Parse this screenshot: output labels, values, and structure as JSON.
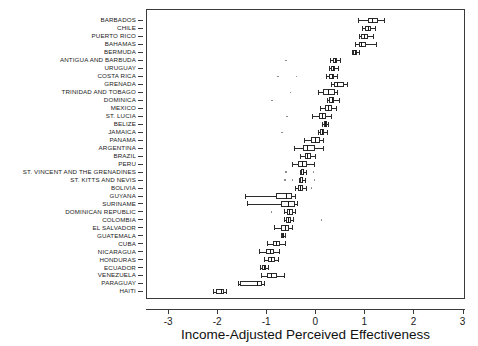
{
  "figure": {
    "artifact_text_top": "cut-off scanned header text",
    "background": "#ffffff",
    "line_color": "#2b2b2b"
  },
  "axis": {
    "x_title": "Income-Adjusted Perceived Effectiveness",
    "x_ticks": [
      -3,
      -2,
      -1,
      0,
      1,
      2,
      3
    ],
    "x_tick_labels": [
      "-3",
      "-2",
      "-1",
      "0",
      "1",
      "2",
      "3"
    ],
    "x_min": -3.45,
    "x_max": 3.05,
    "y_title": "",
    "grid": "off"
  },
  "chart_data": {
    "type": "box",
    "orientation": "horizontal",
    "title": "",
    "subtitle": "",
    "xlabel": "Income-Adjusted Perceived Effectiveness",
    "ylabel": "",
    "xlim": [
      -3.45,
      3.05
    ],
    "legend": "none",
    "categories": [
      "BARBADOS",
      "CHILE",
      "PUERTO RICO",
      "BAHAMAS",
      "BERMUDA",
      "ANTIGUA AND BARBUDA",
      "URUGUAY",
      "COSTA RICA",
      "GRENADA",
      "TRINIDAD AND TOBAGO",
      "DOMINICA",
      "MEXICO",
      "ST. LUCIA",
      "BELIZE",
      "JAMAICA",
      "PANAMA",
      "ARGENTINA",
      "BRAZIL",
      "PERU",
      "ST. VINCENT AND THE GRENADINES",
      "ST. KITTS AND NEVIS",
      "BOLIVIA",
      "GUYANA",
      "SURINAME",
      "DOMINICAN REPUBLIC",
      "COLOMBIA",
      "EL SALVADOR",
      "GUATEMALA",
      "CUBA",
      "NICARAGUA",
      "HONDURAS",
      "ECUADOR",
      "VENEZUELA",
      "PARAGUAY",
      "HAITI"
    ],
    "boxes": [
      {
        "name": "BARBADOS",
        "whisker_low": 0.84,
        "q1": 1.06,
        "median": 1.14,
        "q3": 1.26,
        "whisker_high": 1.37,
        "outliers": []
      },
      {
        "name": "CHILE",
        "whisker_low": 0.94,
        "q1": 1.0,
        "median": 1.06,
        "q3": 1.12,
        "whisker_high": 1.2,
        "outliers": []
      },
      {
        "name": "PUERTO RICO",
        "whisker_low": 0.86,
        "q1": 0.92,
        "median": 0.98,
        "q3": 1.06,
        "whisker_high": 1.16,
        "outliers": []
      },
      {
        "name": "BAHAMAS",
        "whisker_low": 0.78,
        "q1": 0.86,
        "median": 0.92,
        "q3": 1.02,
        "whisker_high": 1.22,
        "outliers": []
      },
      {
        "name": "BERMUDA",
        "whisker_low": 0.72,
        "q1": 0.74,
        "median": 0.78,
        "q3": 0.82,
        "whisker_high": 0.86,
        "outliers": []
      },
      {
        "name": "ANTIGUA AND BARBUDA",
        "whisker_low": 0.28,
        "q1": 0.33,
        "median": 0.38,
        "q3": 0.43,
        "whisker_high": 0.48,
        "outliers": [
          -0.62
        ]
      },
      {
        "name": "URUGUAY",
        "whisker_low": 0.26,
        "q1": 0.3,
        "median": 0.34,
        "q3": 0.39,
        "whisker_high": 0.44,
        "outliers": []
      },
      {
        "name": "COSTA RICA",
        "whisker_low": 0.2,
        "q1": 0.26,
        "median": 0.31,
        "q3": 0.36,
        "whisker_high": 0.42,
        "outliers": [
          -0.78,
          -0.4
        ]
      },
      {
        "name": "GRENADA",
        "whisker_low": 0.3,
        "q1": 0.36,
        "median": 0.42,
        "q3": 0.56,
        "whisker_high": 0.62,
        "outliers": []
      },
      {
        "name": "TRINIDAD AND TOBAGO",
        "whisker_low": 0.03,
        "q1": 0.14,
        "median": 0.24,
        "q3": 0.38,
        "whisker_high": 0.42,
        "outliers": [
          -0.52
        ]
      },
      {
        "name": "DOMINICA",
        "whisker_low": 0.22,
        "q1": 0.26,
        "median": 0.31,
        "q3": 0.36,
        "whisker_high": 0.46,
        "outliers": [
          -0.9
        ]
      },
      {
        "name": "MEXICO",
        "whisker_low": 0.08,
        "q1": 0.18,
        "median": 0.24,
        "q3": 0.32,
        "whisker_high": 0.4,
        "outliers": []
      },
      {
        "name": "ST. LUCIA",
        "whisker_low": -0.08,
        "q1": 0.06,
        "median": 0.12,
        "q3": 0.2,
        "whisker_high": 0.3,
        "outliers": [
          -0.6
        ]
      },
      {
        "name": "BELIZE",
        "whisker_low": 0.12,
        "q1": 0.15,
        "median": 0.18,
        "q3": 0.21,
        "whisker_high": 0.24,
        "outliers": []
      },
      {
        "name": "JAMAICA",
        "whisker_low": 0.04,
        "q1": 0.08,
        "median": 0.12,
        "q3": 0.16,
        "whisker_high": 0.22,
        "outliers": [
          -0.7
        ]
      },
      {
        "name": "PANAMA",
        "whisker_low": -0.26,
        "q1": -0.1,
        "median": -0.02,
        "q3": 0.08,
        "whisker_high": 0.14,
        "outliers": []
      },
      {
        "name": "ARGENTINA",
        "whisker_low": -0.46,
        "q1": -0.28,
        "median": -0.18,
        "q3": -0.02,
        "whisker_high": 0.14,
        "outliers": []
      },
      {
        "name": "BRAZIL",
        "whisker_low": -0.34,
        "q1": -0.24,
        "median": -0.18,
        "q3": -0.1,
        "whisker_high": -0.02,
        "outliers": []
      },
      {
        "name": "PERU",
        "whisker_low": -0.5,
        "q1": -0.38,
        "median": -0.3,
        "q3": -0.18,
        "whisker_high": -0.04,
        "outliers": []
      },
      {
        "name": "ST. VINCENT AND THE GRENADINES",
        "whisker_low": -0.34,
        "q1": -0.31,
        "median": -0.28,
        "q3": -0.25,
        "whisker_high": -0.22,
        "outliers": [
          -0.62,
          -0.06
        ]
      },
      {
        "name": "ST. KITTS AND NEVIS",
        "whisker_low": -0.36,
        "q1": -0.33,
        "median": -0.3,
        "q3": -0.27,
        "whisker_high": -0.24,
        "outliers": [
          -0.64,
          -0.48,
          -0.04
        ]
      },
      {
        "name": "BOLIVIA",
        "whisker_low": -0.44,
        "q1": -0.38,
        "median": -0.34,
        "q3": -0.28,
        "whisker_high": -0.22,
        "outliers": [
          -0.1
        ]
      },
      {
        "name": "GUYANA",
        "whisker_low": -1.46,
        "q1": -0.82,
        "median": -0.62,
        "q3": -0.5,
        "whisker_high": -0.44,
        "outliers": []
      },
      {
        "name": "SURINAME",
        "whisker_low": -1.42,
        "q1": -0.72,
        "median": -0.58,
        "q3": -0.44,
        "whisker_high": -0.4,
        "outliers": []
      },
      {
        "name": "DOMINICAN REPUBLIC",
        "whisker_low": -0.66,
        "q1": -0.6,
        "median": -0.55,
        "q3": -0.48,
        "whisker_high": -0.44,
        "outliers": [
          -0.92
        ]
      },
      {
        "name": "COLOMBIA",
        "whisker_low": -0.66,
        "q1": -0.62,
        "median": -0.58,
        "q3": -0.52,
        "whisker_high": -0.48,
        "outliers": [
          0.1
        ]
      },
      {
        "name": "EL SALVADOR",
        "whisker_low": -0.86,
        "q1": -0.72,
        "median": -0.64,
        "q3": -0.56,
        "whisker_high": -0.5,
        "outliers": []
      },
      {
        "name": "GUATEMALA",
        "whisker_low": -0.72,
        "q1": -0.7,
        "median": -0.68,
        "q3": -0.66,
        "whisker_high": -0.64,
        "outliers": []
      },
      {
        "name": "CUBA",
        "whisker_low": -1.0,
        "q1": -0.88,
        "median": -0.82,
        "q3": -0.74,
        "whisker_high": -0.64,
        "outliers": []
      },
      {
        "name": "NICARAGUA",
        "whisker_low": -1.16,
        "q1": -1.02,
        "median": -0.94,
        "q3": -0.86,
        "whisker_high": -0.76,
        "outliers": []
      },
      {
        "name": "HONDURAS",
        "whisker_low": -1.06,
        "q1": -0.98,
        "median": -0.92,
        "q3": -0.84,
        "whisker_high": -0.78,
        "outliers": []
      },
      {
        "name": "ECUADOR",
        "whisker_low": -1.14,
        "q1": -1.1,
        "median": -1.06,
        "q3": -1.02,
        "whisker_high": -0.98,
        "outliers": []
      },
      {
        "name": "VENEZUELA",
        "whisker_low": -1.12,
        "q1": -1.0,
        "median": -0.92,
        "q3": -0.8,
        "whisker_high": -0.66,
        "outliers": []
      },
      {
        "name": "PARAGUAY",
        "whisker_low": -1.6,
        "q1": -1.56,
        "median": -1.2,
        "q3": -1.1,
        "whisker_high": -1.06,
        "outliers": []
      },
      {
        "name": "HAITI",
        "whisker_low": -2.1,
        "q1": -2.05,
        "median": -1.95,
        "q3": -1.88,
        "whisker_high": -1.84,
        "outliers": []
      }
    ]
  }
}
